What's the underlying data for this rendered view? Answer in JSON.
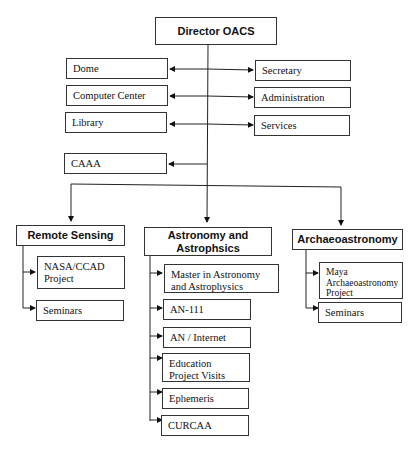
{
  "director": "Director OACS",
  "left_units": [
    "Dome",
    "Computer Center",
    "Library"
  ],
  "right_units": [
    "Secretary",
    "Administration",
    "Services"
  ],
  "caaa": "CAAA",
  "departments": [
    {
      "title": "Remote Sensing",
      "items": [
        "NASA/CCAD Project",
        "Seminars"
      ]
    },
    {
      "title": "Astronomy and Astrophsics",
      "items": [
        "Master in Astronomy and Astrophysics",
        "AN-111",
        "AN / Internet",
        "Education Project Visits",
        "Ephemeris",
        "CURCAA"
      ]
    },
    {
      "title": "Archaeoastronomy",
      "items": [
        "Maya Archaeoastronomy Project",
        "Seminars"
      ]
    }
  ]
}
